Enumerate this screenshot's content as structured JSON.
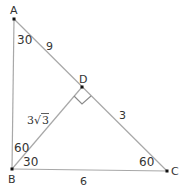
{
  "diagram": {
    "type": "right-triangle-with-altitude",
    "colors": {
      "line": "#a8a8a8",
      "text": "#333333",
      "point": "#111111"
    },
    "points": [
      {
        "id": "A",
        "label": "A",
        "x": 14,
        "y": 19
      },
      {
        "id": "B",
        "label": "B",
        "x": 12,
        "y": 169
      },
      {
        "id": "C",
        "label": "C",
        "x": 167,
        "y": 171
      },
      {
        "id": "D",
        "label": "D",
        "x": 82,
        "y": 87
      }
    ],
    "segments": [
      "AB",
      "AC",
      "BC",
      "BD"
    ],
    "right_angle_at": "D",
    "length_labels": {
      "AD": "9",
      "DC": "3",
      "BD_coef": "3",
      "BD_rad": "3",
      "BC": "6"
    },
    "angle_labels": {
      "A": "30",
      "B_upper": "60",
      "B_lower": "30",
      "C": "60"
    }
  }
}
